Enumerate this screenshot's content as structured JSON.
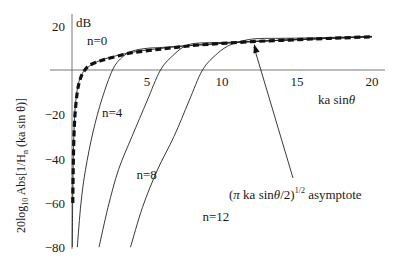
{
  "chart_data": {
    "type": "line",
    "title": "",
    "xlabel": "ka sinθ",
    "ylabel": "20log10 Abs[1/Hn (ka sin θ)]",
    "yunit": "dB",
    "xlim": [
      0,
      20
    ],
    "ylim": [
      -80,
      20
    ],
    "grid": false,
    "xticks": [
      5,
      10,
      15,
      20
    ],
    "xtick_labels": [
      "5",
      "10",
      "15",
      "20"
    ],
    "yticks": [
      20,
      -20,
      -40,
      -60,
      -80
    ],
    "ytick_labels": [
      "20",
      "−20",
      "−40",
      "−60",
      "−80"
    ],
    "series": [
      {
        "name": "n=0",
        "style": "solid",
        "points": [
          [
            0.02,
            -80
          ],
          [
            0.05,
            -55
          ],
          [
            0.1,
            -35
          ],
          [
            0.2,
            -18
          ],
          [
            0.4,
            -7
          ],
          [
            0.7,
            -1.5
          ],
          [
            1,
            1
          ],
          [
            2,
            4.6
          ],
          [
            4,
            8
          ],
          [
            6,
            9.8
          ],
          [
            8,
            11.1
          ],
          [
            12,
            12.8
          ],
          [
            16,
            14
          ],
          [
            20,
            15
          ]
        ]
      },
      {
        "name": "n=4",
        "style": "solid",
        "points": [
          [
            0.35,
            -80
          ],
          [
            0.6,
            -60
          ],
          [
            0.9,
            -45
          ],
          [
            1.4,
            -28
          ],
          [
            2,
            -13
          ],
          [
            2.7,
            0
          ],
          [
            3.3,
            5.5
          ],
          [
            4,
            8.5
          ],
          [
            5,
            9.8
          ],
          [
            6,
            10.2
          ],
          [
            8,
            11.1
          ],
          [
            12,
            12.8
          ],
          [
            16,
            14
          ],
          [
            20,
            15
          ]
        ]
      },
      {
        "name": "n=8",
        "style": "solid",
        "points": [
          [
            1.8,
            -80
          ],
          [
            2.4,
            -62
          ],
          [
            3.1,
            -45
          ],
          [
            4,
            -30
          ],
          [
            5,
            -14
          ],
          [
            5.9,
            0
          ],
          [
            6.8,
            7
          ],
          [
            7.6,
            11
          ],
          [
            8.5,
            12.2
          ],
          [
            10,
            12.4
          ],
          [
            12,
            12.9
          ],
          [
            16,
            14
          ],
          [
            20,
            15
          ]
        ]
      },
      {
        "name": "n=12",
        "style": "solid",
        "points": [
          [
            3.9,
            -80
          ],
          [
            4.7,
            -62
          ],
          [
            5.7,
            -45
          ],
          [
            6.8,
            -30
          ],
          [
            7.8,
            -14
          ],
          [
            8.7,
            0
          ],
          [
            9.7,
            7.5
          ],
          [
            10.6,
            11.5
          ],
          [
            11.6,
            13.5
          ],
          [
            12.5,
            14.2
          ],
          [
            14,
            14.3
          ],
          [
            16,
            14.5
          ],
          [
            20,
            15.2
          ]
        ]
      },
      {
        "name": "(π ka sinθ/2)^1/2 asymptote",
        "style": "dashed-thick",
        "points": [
          [
            0.05,
            -60
          ],
          [
            0.08,
            -45
          ],
          [
            0.12,
            -32
          ],
          [
            0.2,
            -20
          ],
          [
            0.35,
            -10
          ],
          [
            0.55,
            -4
          ],
          [
            0.8,
            -0.5
          ],
          [
            1.2,
            2.2
          ],
          [
            2,
            4.4
          ],
          [
            3,
            6.2
          ],
          [
            4,
            7.8
          ],
          [
            6,
            9.5
          ],
          [
            8,
            11
          ],
          [
            10,
            12
          ],
          [
            12,
            12.8
          ],
          [
            14,
            13.4
          ],
          [
            16,
            14
          ],
          [
            18,
            14.5
          ],
          [
            20,
            15
          ]
        ]
      }
    ],
    "annotations": [
      {
        "text": "n=0",
        "x": 1.0,
        "y": 11.5
      },
      {
        "text": "n=4",
        "x": 2.0,
        "y": -21
      },
      {
        "text": "n=8",
        "x": 4.3,
        "y": -49
      },
      {
        "text": "n=12",
        "x": 8.7,
        "y": -68
      },
      {
        "text": "(π ka sinθ/2)^1/2 asymptote",
        "x": 10.4,
        "y": -58,
        "arrow_to": [
          12.1,
          11.8
        ]
      }
    ]
  },
  "labels": {
    "unit": "dB",
    "xlabel_main": "ka sin",
    "xlabel_theta": "θ",
    "ylabel_pre": "20log",
    "ylabel_sub10": "10",
    "ylabel_mid": " Abs[1/H",
    "ylabel_subn": "n",
    "ylabel_post": " (ka sin θ)]",
    "annot_paren_open": "(",
    "annot_pi": "π",
    "annot_body": " ka sin",
    "annot_theta": "θ",
    "annot_close": "/2)",
    "annot_sup": "1/2",
    "annot_tail": " asymptote"
  }
}
